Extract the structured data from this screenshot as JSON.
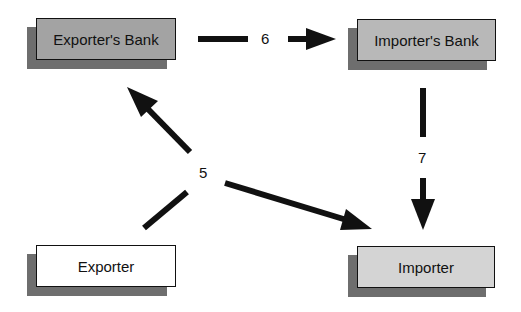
{
  "diagram": {
    "nodes": [
      {
        "id": "exporters-bank",
        "label": "Exporter's Bank",
        "fill": "#a3a3a3"
      },
      {
        "id": "importers-bank",
        "label": "Importer's Bank",
        "fill": "#b8b8b8"
      },
      {
        "id": "exporter",
        "label": "Exporter",
        "fill": "#ffffff"
      },
      {
        "id": "importer",
        "label": "Importer",
        "fill": "#d4d4d4"
      }
    ],
    "edges": [
      {
        "step": "5",
        "from": "exporter",
        "to": "exporters-bank"
      },
      {
        "step": "5",
        "from": "exporter",
        "to": "importer"
      },
      {
        "step": "6",
        "from": "exporters-bank",
        "to": "importers-bank"
      },
      {
        "step": "7",
        "from": "importers-bank",
        "to": "importer"
      }
    ],
    "labels": {
      "step5": "5",
      "step6": "6",
      "step7": "7"
    },
    "colors": {
      "shadow": "#6e6e6e",
      "arrow": "#111111",
      "border": "#111111"
    }
  }
}
